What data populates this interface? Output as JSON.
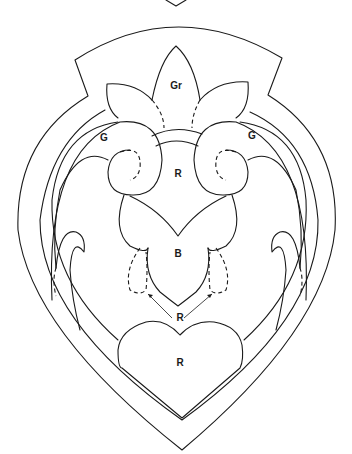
{
  "diagram": {
    "type": "applique-pattern",
    "shape": "heart-shield",
    "colors": {
      "line": "#1a1a1a",
      "background": "#ffffff"
    },
    "labels": {
      "top_flower": "Gr",
      "left_scroll": "G",
      "right_scroll": "G",
      "center_upper": "R",
      "center_lower": "B",
      "pointer_label": "R",
      "bottom_heart": "R"
    }
  }
}
